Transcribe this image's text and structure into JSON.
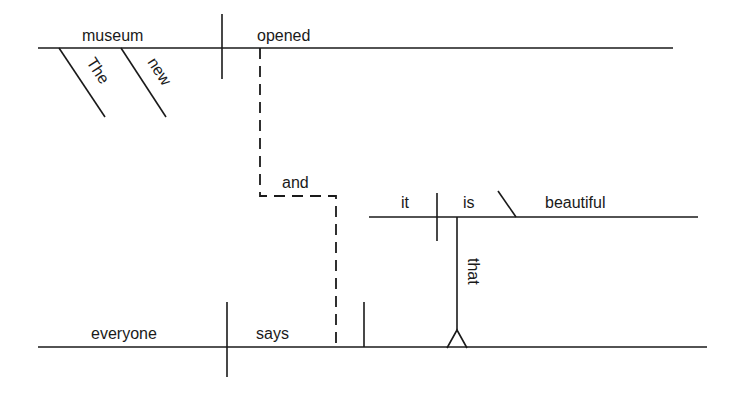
{
  "diagram": {
    "type": "sentence-diagram",
    "sentence": "The new museum opened and everyone says that it is beautiful",
    "clause1": {
      "subject": "museum",
      "verb": "opened",
      "modifiers": [
        "The",
        "new"
      ]
    },
    "conjunction": "and",
    "clause2": {
      "subject": "everyone",
      "verb": "says",
      "object_clause": {
        "connector": "that",
        "subject": "it",
        "verb": "is",
        "complement": "beautiful"
      }
    }
  }
}
